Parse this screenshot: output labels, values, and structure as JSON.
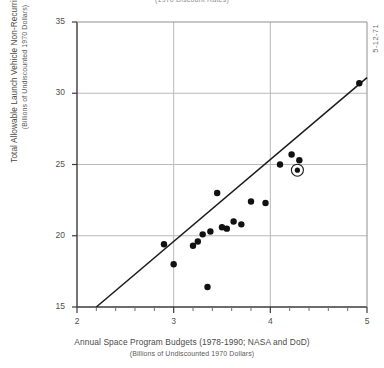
{
  "figure": {
    "top_note": "(1970 Discount Rates)",
    "date_stamp": "5-12-71",
    "ylabel_main": "Total Allowable Launch Vehicle Non-Recurring Cost",
    "ylabel_sub": "(Billions of Undiscounted 1970 Dollars)",
    "xlabel_main": "Annual Space Program Budgets (1978-1990; NASA and DoD)",
    "xlabel_sub": "(Billions of Undiscounted 1970 Dollars)"
  },
  "chart_data": {
    "type": "scatter",
    "title": "",
    "xlabel": "Annual Space Program Budgets (1978-1990; NASA and DoD) (Billions of Undiscounted 1970 Dollars)",
    "ylabel": "Total Allowable Launch Vehicle Non-Recurring Cost (Billions of Undiscounted 1970 Dollars)",
    "xlim": [
      2,
      5
    ],
    "ylim": [
      15,
      35
    ],
    "xticks": [
      2,
      3,
      4,
      5
    ],
    "xtick_labels": [
      "2",
      "3",
      "4",
      "5"
    ],
    "xminor_ticks": [
      2.2,
      2.4,
      2.6,
      2.8,
      3.2,
      3.4,
      3.6,
      3.8,
      4.2,
      4.4,
      4.6,
      4.8
    ],
    "yticks": [
      15,
      20,
      25,
      30,
      35
    ],
    "ytick_labels": [
      "15",
      "20",
      "25",
      "30",
      "35"
    ],
    "grid": true,
    "gridlines_x": [
      3,
      4
    ],
    "gridlines_y": [
      20,
      25,
      30
    ],
    "legend": null,
    "points": [
      {
        "x": 2.9,
        "y": 19.4,
        "circled": false
      },
      {
        "x": 3.0,
        "y": 18.0,
        "circled": false
      },
      {
        "x": 3.2,
        "y": 19.3,
        "circled": false
      },
      {
        "x": 3.25,
        "y": 19.6,
        "circled": false
      },
      {
        "x": 3.3,
        "y": 20.1,
        "circled": false
      },
      {
        "x": 3.35,
        "y": 16.4,
        "circled": false
      },
      {
        "x": 3.38,
        "y": 20.3,
        "circled": false
      },
      {
        "x": 3.45,
        "y": 23.0,
        "circled": false
      },
      {
        "x": 3.5,
        "y": 20.6,
        "circled": false
      },
      {
        "x": 3.55,
        "y": 20.5,
        "circled": false
      },
      {
        "x": 3.62,
        "y": 21.0,
        "circled": false
      },
      {
        "x": 3.7,
        "y": 20.8,
        "circled": false
      },
      {
        "x": 3.8,
        "y": 22.4,
        "circled": false
      },
      {
        "x": 3.95,
        "y": 22.3,
        "circled": false
      },
      {
        "x": 4.1,
        "y": 25.0,
        "circled": false
      },
      {
        "x": 4.22,
        "y": 25.7,
        "circled": false
      },
      {
        "x": 4.3,
        "y": 25.3,
        "circled": false
      },
      {
        "x": 4.28,
        "y": 24.6,
        "circled": true
      },
      {
        "x": 4.92,
        "y": 30.7,
        "circled": false
      }
    ],
    "fit_line": {
      "x0": 2.2,
      "y0": 15.0,
      "x1": 5.0,
      "y1": 31.1
    }
  }
}
